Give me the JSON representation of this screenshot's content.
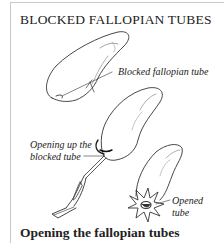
{
  "title": "BLOCKED FALLOPIAN TUBES",
  "caption": "Opening the fallopian tubes",
  "labels": {
    "blocked": "Blocked fallopian tube",
    "opening_line1": "Opening up the",
    "opening_line2": "blocked tube",
    "opened_line1": "Opened",
    "opened_line2": "tube"
  },
  "figures": [
    {
      "name": "blocked-tube-illustration"
    },
    {
      "name": "opening-tube-illustration"
    },
    {
      "name": "opened-tube-illustration"
    }
  ]
}
